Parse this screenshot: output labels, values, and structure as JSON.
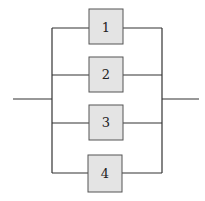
{
  "diagram": {
    "type": "parallel-system-block-diagram",
    "blocks": [
      {
        "label": "1",
        "x": 89,
        "y": 9,
        "w": 34,
        "h": 35,
        "wire_y": 28
      },
      {
        "label": "2",
        "x": 89,
        "y": 57,
        "w": 34,
        "h": 35,
        "wire_y": 75
      },
      {
        "label": "3",
        "x": 89,
        "y": 105,
        "w": 34,
        "h": 35,
        "wire_y": 123
      },
      {
        "label": "4",
        "x": 88,
        "y": 155,
        "w": 34,
        "h": 37,
        "wire_y": 173
      }
    ],
    "input_line": {
      "x1": 13,
      "x2": 52,
      "y": 99
    },
    "output_line": {
      "x1": 162,
      "x2": 199,
      "y": 99
    },
    "left_bus_x": 52,
    "right_bus_x": 162,
    "colors": {
      "line": "#333333",
      "block_fill": "#e4e4e4",
      "block_stroke": "#555555"
    }
  }
}
